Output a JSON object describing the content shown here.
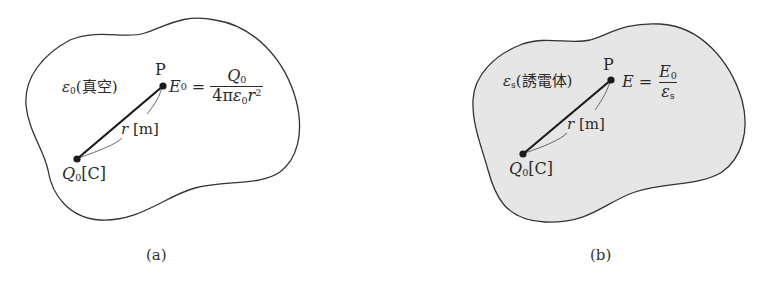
{
  "figure": {
    "panels": [
      {
        "id": "a",
        "caption": "(a)",
        "medium_label": {
          "symbol": "ε",
          "subscript": "0",
          "text": "(真空)"
        },
        "point_label": "P",
        "field_symbol": {
          "symbol": "E",
          "subscript": "0"
        },
        "equals": "=",
        "formula": {
          "numerator": {
            "symbol": "Q",
            "subscript": "0"
          },
          "denominator": {
            "prefix": "4π",
            "eps": "ε",
            "eps_sub": "0",
            "r": "r",
            "r_sup": "2"
          }
        },
        "distance_label": {
          "symbol": "r",
          "unit": "[m]"
        },
        "charge_label": {
          "symbol": "Q",
          "subscript": "0",
          "unit": "[C]"
        },
        "fill": "#ffffff"
      },
      {
        "id": "b",
        "caption": "(b)",
        "medium_label": {
          "symbol": "ε",
          "subscript": "s",
          "text": "(誘電体)"
        },
        "point_label": "P",
        "field_symbol": {
          "symbol": "E",
          "subscript": ""
        },
        "equals": "=",
        "formula": {
          "numerator": {
            "symbol": "E",
            "subscript": "0"
          },
          "denominator": {
            "symbol": "ε",
            "subscript": "s"
          }
        },
        "distance_label": {
          "symbol": "r",
          "unit": "[m]"
        },
        "charge_label": {
          "symbol": "Q",
          "subscript": "0",
          "unit": "[C]"
        },
        "fill": "#e6e6e6"
      }
    ],
    "colors": {
      "outline": "#333333",
      "line": "#1a1a1a",
      "text": "#2a2a2a",
      "dielectric_fill": "#e6e6e6"
    }
  }
}
